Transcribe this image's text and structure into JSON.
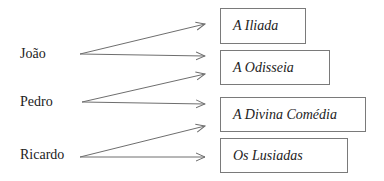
{
  "diagram": {
    "type": "mapping",
    "people": [
      {
        "id": "joao",
        "label": "João"
      },
      {
        "id": "pedro",
        "label": "Pedro"
      },
      {
        "id": "ricardo",
        "label": "Ricardo"
      }
    ],
    "books": [
      {
        "id": "iliada",
        "label": "A Iliada"
      },
      {
        "id": "odisseia",
        "label": "A Odisseia"
      },
      {
        "id": "divina",
        "label": "A Divina Comédia"
      },
      {
        "id": "lusiadas",
        "label": "Os Lusiadas"
      }
    ],
    "arrows": [
      {
        "from": "João",
        "to_slot": 1
      },
      {
        "from": "João",
        "to_slot": 2
      },
      {
        "from": "Pedro",
        "to_slot": 3
      },
      {
        "from": "Pedro",
        "to_slot": 4
      },
      {
        "from": "Ricardo",
        "to_slot": 5
      },
      {
        "from": "Ricardo",
        "to_slot": 6
      }
    ],
    "colors": {
      "line": "#6e6e6e",
      "box_border": "#7a7a7a",
      "text": "#222222"
    }
  }
}
